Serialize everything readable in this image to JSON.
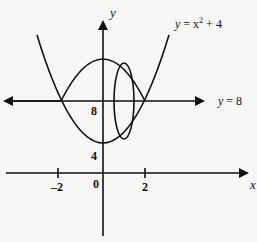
{
  "diagram": {
    "axes": {
      "x_label": "x",
      "y_label": "y",
      "x_ticks": [
        "-2",
        "0",
        "2"
      ],
      "y_ticks": [
        "4",
        "8"
      ]
    },
    "curves": {
      "parabola_label": "y = x² + 4",
      "line_label": "y = 8"
    },
    "labels": {
      "y_axis": "y",
      "x_axis": "x",
      "parabola_y": "y",
      "parabola_eq": "= x",
      "parabola_sup": "2",
      "parabola_tail": "+ 4",
      "line_y": "y",
      "line_eq": "= 8",
      "tick_neg2": "–2",
      "tick_0": "0",
      "tick_2": "2",
      "tick_4": "4",
      "tick_8": "8"
    },
    "colors": {
      "ink": "#111111",
      "background": "#f7f7f5"
    }
  }
}
